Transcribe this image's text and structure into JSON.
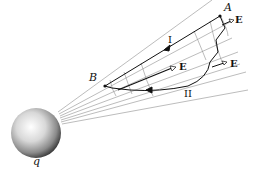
{
  "diagram": {
    "type": "electrostatic field work path diagram",
    "charge_label": "q",
    "point_a_label": "A",
    "point_b_label": "B",
    "path_1_label": "I",
    "path_2_label": "II",
    "field_labels": [
      "E",
      "E",
      "E"
    ],
    "colors": {
      "ink": "#111111",
      "grid": "#9a9a9a",
      "background": "#ffffff"
    }
  }
}
